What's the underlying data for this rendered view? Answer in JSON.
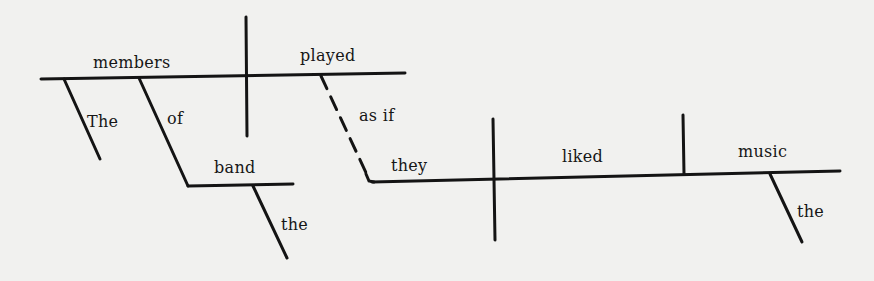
{
  "diagram": {
    "type": "sentence-diagram",
    "sentence": "The members of the band played as if they liked the music",
    "colors": {
      "ink": "#141414",
      "paper": "#f1f1ef"
    },
    "main_clause": {
      "subject": "members",
      "verb": "played",
      "modifiers": {
        "subject_article": "The",
        "preposition": "of",
        "prep_object": "band",
        "prep_object_article": "the"
      }
    },
    "connector": "as if",
    "subordinate_clause": {
      "subject": "they",
      "verb": "liked",
      "object": "music",
      "object_article": "the"
    }
  }
}
